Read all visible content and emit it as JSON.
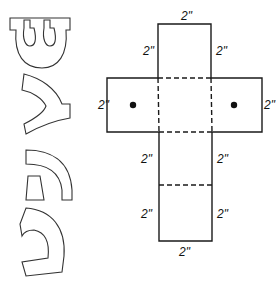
{
  "diagram": {
    "type": "box-net-template",
    "dimension_labels": {
      "top_edge": "2\"",
      "upper_left_side": "2\"",
      "upper_right_side": "2\"",
      "left_arm_end": "2\"",
      "right_arm_end": "2\"",
      "lower_left_side_1": "2\"",
      "lower_right_side_1": "2\"",
      "lower_left_side_2": "2\"",
      "lower_right_side_2": "2\"",
      "bottom_edge": "2\""
    },
    "fold_lines": "dashed",
    "holes": 2,
    "letter_cutouts": [
      "shin",
      "gimel",
      "hei",
      "nun"
    ]
  },
  "colors": {
    "line": "#1a1a1a",
    "background": "#ffffff"
  }
}
